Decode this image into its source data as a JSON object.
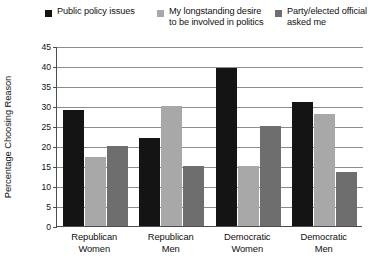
{
  "chart_data": {
    "type": "bar",
    "title": "",
    "xlabel": "",
    "ylabel": "Percentage Choosing Reason",
    "ylim": [
      0,
      45
    ],
    "yticks": [
      0,
      5,
      10,
      15,
      20,
      25,
      30,
      35,
      40,
      45
    ],
    "grid": true,
    "legend_position": "top",
    "categories": [
      "Republican Women",
      "Republican Men",
      "Democratic Women",
      "Democratic Men"
    ],
    "category_lines": [
      [
        "Republican",
        "Women"
      ],
      [
        "Republican",
        "Men"
      ],
      [
        "Democratic",
        "Women"
      ],
      [
        "Democratic",
        "Men"
      ]
    ],
    "series": [
      {
        "name": "Public policy issues",
        "color": "#141414",
        "values": [
          29,
          22,
          39.5,
          31
        ]
      },
      {
        "name": "My longstanding desire to be involved in politics",
        "color": "#a8a8a8",
        "values": [
          17.3,
          30,
          15,
          28
        ]
      },
      {
        "name": "Party/elected official asked me",
        "color": "#6e6e6e",
        "values": [
          20,
          15,
          25,
          13.5
        ]
      }
    ]
  },
  "legend": {
    "items": [
      {
        "label_line1": "Public policy issues",
        "label_line2": ""
      },
      {
        "label_line1": "My longstanding desire",
        "label_line2": "to be involved in politics"
      },
      {
        "label_line1": "Party/elected official",
        "label_line2": "asked me"
      }
    ]
  }
}
